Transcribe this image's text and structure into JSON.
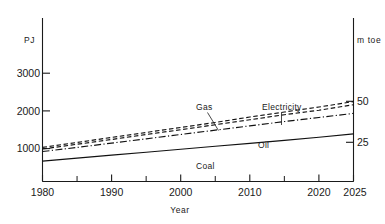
{
  "chart_data": {
    "type": "line",
    "title": "",
    "xlabel": "Year",
    "ylabel": "PJ",
    "y2label": "m toe",
    "xlim": [
      1980,
      2025
    ],
    "ylim": [
      0,
      3600
    ],
    "y2lim": [
      0,
      86
    ],
    "grid": false,
    "legend_position": "inline-annotations",
    "x_ticks": [
      1980,
      1990,
      2000,
      2010,
      2020,
      2025
    ],
    "x_tick_labels": [
      "1980",
      "1990",
      "2000",
      "2010",
      "2020",
      "2025"
    ],
    "x_minor_ticks": [
      1985,
      1995,
      2005,
      2015
    ],
    "y_ticks": [
      1000,
      2000,
      3000
    ],
    "y_tick_labels": [
      "1000",
      "2000",
      "3000"
    ],
    "y2_ticks": [
      25,
      50
    ],
    "y2_tick_labels": [
      "25",
      "50"
    ],
    "x": [
      1980,
      1985,
      1990,
      1995,
      2000,
      2005,
      2010,
      2015,
      2020,
      2025
    ],
    "series": [
      {
        "name": "Gas",
        "style": "dashed",
        "values": [
          750,
          860,
          970,
          1080,
          1190,
          1300,
          1420,
          1530,
          1640,
          1760
        ]
      },
      {
        "name": "Electricity",
        "style": "dashed",
        "values": [
          715,
          820,
          925,
          1035,
          1140,
          1250,
          1360,
          1470,
          1570,
          1690
        ]
      },
      {
        "name": "Oil",
        "style": "dash-dot",
        "values": [
          660,
          750,
          845,
          940,
          1035,
          1130,
          1225,
          1320,
          1410,
          1500
        ]
      },
      {
        "name": "Coal",
        "style": "solid",
        "values": [
          450,
          515,
          580,
          645,
          710,
          775,
          840,
          905,
          975,
          1050
        ]
      }
    ],
    "annotations": [
      {
        "text": "Gas",
        "series": "Gas",
        "has_leader": true
      },
      {
        "text": "Electricity",
        "series": "Electricity",
        "has_leader": true
      },
      {
        "text": "Oil",
        "series": "Oil",
        "has_leader": false
      },
      {
        "text": "Coal",
        "series": "Coal",
        "has_leader": false
      }
    ],
    "colors": {
      "ink": "#111111",
      "background": "#ffffff"
    }
  },
  "labels": {
    "left_axis_unit": "PJ",
    "right_axis_unit": "m toe",
    "x_axis_title": "Year",
    "y_tick_1000": "1000",
    "y_tick_2000": "2000",
    "y_tick_3000": "3000",
    "y2_tick_25": "25",
    "y2_tick_50": "50",
    "x_tick_1980": "1980",
    "x_tick_1990": "1990",
    "x_tick_2000": "2000",
    "x_tick_2010": "2010",
    "x_tick_2020": "2020",
    "x_tick_2025": "2025",
    "series_gas": "Gas",
    "series_electricity": "Electricity",
    "series_oil": "Oil",
    "series_coal": "Coal"
  }
}
